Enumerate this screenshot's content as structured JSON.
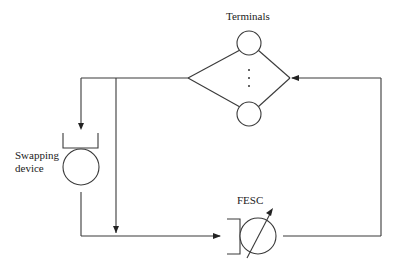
{
  "diagram": {
    "type": "queueing-network",
    "labels": {
      "terminals": "Terminals",
      "swapping_device_line1": "Swapping",
      "swapping_device_line2": "device",
      "fesc": "FESC"
    },
    "nodes": [
      {
        "id": "terminals",
        "kind": "infinite-server (delay) station",
        "label": "Terminals"
      },
      {
        "id": "swapping-device",
        "kind": "queue with single server",
        "label": "Swapping device"
      },
      {
        "id": "fesc",
        "kind": "flow-equivalent service center (variable-rate server)",
        "label": "FESC"
      }
    ],
    "edges": [
      {
        "from": "terminals",
        "to": "swapping-device"
      },
      {
        "from": "terminals",
        "to": "fesc",
        "note": "bypass branch"
      },
      {
        "from": "swapping-device",
        "to": "fesc"
      },
      {
        "from": "fesc",
        "to": "terminals"
      }
    ]
  }
}
